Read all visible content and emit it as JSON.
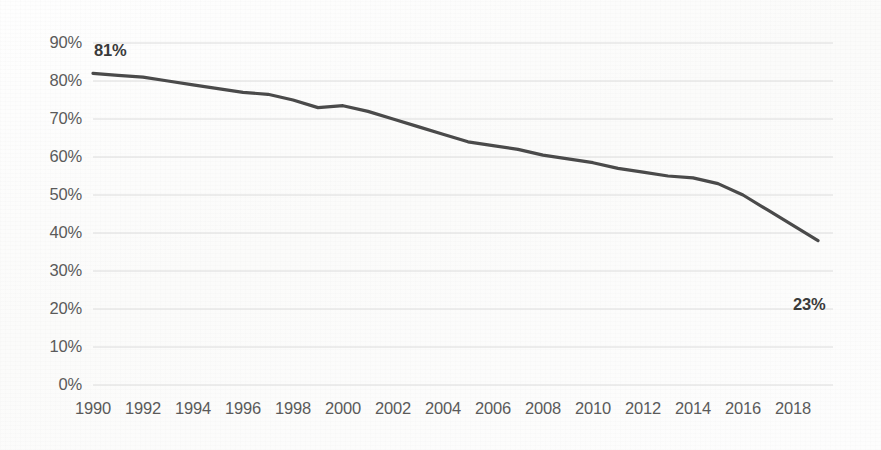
{
  "chart_data": {
    "type": "line",
    "title": "",
    "subtitle": "",
    "xlabel": "",
    "ylabel": "",
    "xlim": [
      1990,
      2019
    ],
    "ylim": [
      0,
      90
    ],
    "grid": true,
    "legend": null,
    "y_tick_labels": [
      "90%",
      "80%",
      "70%",
      "60%",
      "50%",
      "40%",
      "30%",
      "20%",
      "10%",
      "0%"
    ],
    "y_tick_values": [
      90,
      80,
      70,
      60,
      50,
      40,
      30,
      20,
      10,
      0
    ],
    "x_tick_labels": [
      "1990",
      "1992",
      "1994",
      "1996",
      "1998",
      "2000",
      "2002",
      "2004",
      "2006",
      "2008",
      "2010",
      "2012",
      "2014",
      "2016",
      "2018"
    ],
    "x_tick_values": [
      1990,
      1992,
      1994,
      1996,
      1998,
      2000,
      2002,
      2004,
      2006,
      2008,
      2010,
      2012,
      2014,
      2016,
      2018
    ],
    "series": [
      {
        "name": "percent",
        "color": "#4a4a4a",
        "x": [
          1990,
          1991,
          1992,
          1993,
          1994,
          1995,
          1996,
          1997,
          1998,
          1999,
          2000,
          2001,
          2002,
          2003,
          2004,
          2005,
          2006,
          2007,
          2008,
          2009,
          2010,
          2011,
          2012,
          2013,
          2014,
          2015,
          2016,
          2017,
          2018,
          2019
        ],
        "values": [
          82,
          81.5,
          81,
          80,
          79,
          78,
          77,
          76.5,
          75,
          73,
          73.5,
          72,
          70,
          68,
          66,
          64,
          63,
          62,
          60.5,
          59.5,
          58.5,
          57,
          56,
          55,
          54.5,
          53,
          50,
          46,
          42,
          38
        ]
      }
    ],
    "annotations": [
      {
        "name": "start-value-label",
        "text": "81%",
        "x": 1990,
        "y": 82
      },
      {
        "name": "end-value-label",
        "text": "23%",
        "x": 2019,
        "y": 23
      }
    ],
    "colors": {
      "line": "#4a4a4a",
      "gridline": "#dcdcdc",
      "tick_text": "#5a5a5a",
      "label_text": "#3a3a3a",
      "background": "#fdfdfc"
    }
  }
}
